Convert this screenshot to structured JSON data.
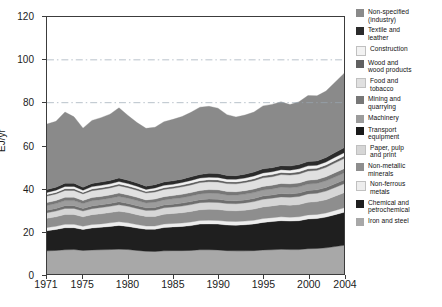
{
  "chart_data": {
    "type": "area",
    "title": "",
    "xlabel": "",
    "ylabel": "EJ/yr",
    "xlim": [
      1971,
      2004
    ],
    "ylim": [
      0,
      120
    ],
    "ytick_values": [
      0,
      20,
      40,
      60,
      80,
      100,
      120
    ],
    "xtick_values": [
      1971,
      1975,
      1980,
      1985,
      1990,
      1995,
      2000,
      2004
    ],
    "grid": "horizontal-dashed-at-80-and-100",
    "legend_position": "right",
    "stack_order_bottom_to_top": [
      "Iron and steel",
      "Chemical and petrochemical",
      "Non-ferrous metals",
      "Non-metallic minerals",
      "Paper, pulp and print",
      "Transport equipment",
      "Machinery",
      "Mining and quarrying",
      "Food and tobacco",
      "Wood and wood products",
      "Construction",
      "Textile and leather",
      "Non-specified (industry)"
    ],
    "x": [
      1971,
      1972,
      1973,
      1974,
      1975,
      1976,
      1977,
      1978,
      1979,
      1980,
      1981,
      1982,
      1983,
      1984,
      1985,
      1986,
      1987,
      1988,
      1989,
      1990,
      1991,
      1992,
      1993,
      1994,
      1995,
      1996,
      1997,
      1998,
      1999,
      2000,
      2001,
      2002,
      2003,
      2004
    ],
    "series": [
      {
        "name": "Iron and steel",
        "color": "#a8a8a8",
        "values": [
          10.8,
          11.0,
          11.3,
          11.4,
          11.0,
          11.2,
          11.3,
          11.4,
          11.6,
          11.4,
          11.0,
          10.6,
          10.5,
          10.8,
          10.9,
          10.9,
          11.0,
          11.3,
          11.3,
          11.2,
          10.9,
          10.8,
          10.8,
          10.9,
          11.2,
          11.3,
          11.5,
          11.4,
          11.4,
          11.8,
          11.9,
          12.2,
          12.8,
          13.4
        ]
      },
      {
        "name": "Chemical and petrochemical",
        "color": "#1f1f1f",
        "values": [
          9.4,
          9.8,
          10.3,
          10.2,
          9.8,
          10.3,
          10.5,
          10.8,
          11.1,
          10.8,
          10.5,
          10.3,
          10.4,
          10.9,
          11.1,
          11.3,
          11.6,
          12.0,
          12.1,
          12.1,
          12.0,
          12.0,
          12.2,
          12.5,
          12.9,
          13.2,
          13.4,
          13.3,
          13.5,
          13.9,
          14.0,
          14.4,
          14.9,
          15.4
        ]
      },
      {
        "name": "Non-ferrous metals",
        "color": "#ededed",
        "values": [
          1.5,
          1.5,
          1.6,
          1.6,
          1.5,
          1.6,
          1.6,
          1.7,
          1.7,
          1.7,
          1.6,
          1.5,
          1.5,
          1.6,
          1.6,
          1.6,
          1.7,
          1.7,
          1.7,
          1.7,
          1.7,
          1.7,
          1.7,
          1.7,
          1.8,
          1.8,
          1.8,
          1.8,
          1.8,
          1.9,
          1.9,
          1.9,
          2.0,
          2.1
        ]
      },
      {
        "name": "Non-metallic minerals",
        "color": "#8e8e8e",
        "values": [
          4.3,
          4.4,
          4.6,
          4.6,
          4.4,
          4.6,
          4.7,
          4.8,
          4.9,
          4.8,
          4.6,
          4.5,
          4.5,
          4.6,
          4.7,
          4.8,
          4.9,
          5.0,
          5.1,
          5.1,
          5.0,
          5.0,
          5.1,
          5.2,
          5.4,
          5.5,
          5.6,
          5.6,
          5.7,
          5.9,
          6.0,
          6.2,
          6.6,
          7.0
        ]
      },
      {
        "name": "Paper, pulp and print",
        "color": "#d6d6d6",
        "values": [
          2.6,
          2.7,
          2.8,
          2.8,
          2.7,
          2.8,
          2.9,
          2.9,
          3.0,
          2.9,
          2.9,
          2.8,
          2.9,
          3.0,
          3.0,
          3.1,
          3.2,
          3.3,
          3.3,
          3.3,
          3.3,
          3.3,
          3.4,
          3.5,
          3.6,
          3.6,
          3.7,
          3.7,
          3.8,
          3.9,
          3.9,
          4.0,
          4.1,
          4.2
        ]
      },
      {
        "name": "Transport equipment",
        "color": "#6e6e6e",
        "values": [
          1.2,
          1.2,
          1.3,
          1.3,
          1.2,
          1.3,
          1.3,
          1.3,
          1.4,
          1.3,
          1.3,
          1.2,
          1.3,
          1.3,
          1.3,
          1.4,
          1.4,
          1.4,
          1.5,
          1.5,
          1.4,
          1.4,
          1.4,
          1.5,
          1.5,
          1.5,
          1.6,
          1.6,
          1.6,
          1.6,
          1.6,
          1.7,
          1.7,
          1.8
        ]
      },
      {
        "name": "Machinery",
        "color": "#9c9c9c",
        "values": [
          2.2,
          2.3,
          2.4,
          2.4,
          2.3,
          2.4,
          2.4,
          2.5,
          2.5,
          2.5,
          2.4,
          2.3,
          2.4,
          2.4,
          2.5,
          2.5,
          2.6,
          2.7,
          2.7,
          2.7,
          2.6,
          2.6,
          2.7,
          2.7,
          2.8,
          2.8,
          2.9,
          2.9,
          2.9,
          3.0,
          3.0,
          3.1,
          3.2,
          3.3
        ]
      },
      {
        "name": "Mining and quarrying",
        "color": "#777777",
        "values": [
          1.4,
          1.4,
          1.5,
          1.5,
          1.4,
          1.5,
          1.5,
          1.5,
          1.6,
          1.5,
          1.5,
          1.4,
          1.5,
          1.5,
          1.5,
          1.6,
          1.6,
          1.6,
          1.7,
          1.7,
          1.6,
          1.6,
          1.6,
          1.7,
          1.7,
          1.7,
          1.8,
          1.8,
          1.8,
          1.8,
          1.8,
          1.9,
          2.0,
          2.0
        ]
      },
      {
        "name": "Food and tobacco",
        "color": "#e0e0e0",
        "values": [
          3.0,
          3.1,
          3.2,
          3.2,
          3.1,
          3.2,
          3.3,
          3.3,
          3.4,
          3.4,
          3.3,
          3.2,
          3.3,
          3.4,
          3.4,
          3.5,
          3.6,
          3.7,
          3.7,
          3.7,
          3.7,
          3.7,
          3.8,
          3.9,
          4.0,
          4.0,
          4.1,
          4.1,
          4.2,
          4.3,
          4.3,
          4.4,
          4.6,
          4.7
        ]
      },
      {
        "name": "Wood and wood products",
        "color": "#606060",
        "values": [
          0.7,
          0.7,
          0.8,
          0.8,
          0.7,
          0.8,
          0.8,
          0.8,
          0.8,
          0.8,
          0.8,
          0.7,
          0.8,
          0.8,
          0.8,
          0.8,
          0.9,
          0.9,
          0.9,
          0.9,
          0.9,
          0.9,
          0.9,
          0.9,
          1.0,
          1.0,
          1.0,
          1.0,
          1.0,
          1.0,
          1.0,
          1.1,
          1.1,
          1.2
        ]
      },
      {
        "name": "Construction",
        "color": "#f2f2f2",
        "values": [
          1.0,
          1.0,
          1.1,
          1.1,
          1.0,
          1.1,
          1.1,
          1.1,
          1.2,
          1.1,
          1.1,
          1.0,
          1.1,
          1.1,
          1.1,
          1.2,
          1.2,
          1.2,
          1.2,
          1.2,
          1.2,
          1.2,
          1.2,
          1.3,
          1.3,
          1.3,
          1.3,
          1.3,
          1.4,
          1.4,
          1.4,
          1.4,
          1.5,
          1.5
        ]
      },
      {
        "name": "Textile and leather",
        "color": "#2b2b2b",
        "values": [
          1.4,
          1.4,
          1.5,
          1.5,
          1.4,
          1.5,
          1.5,
          1.6,
          1.6,
          1.6,
          1.5,
          1.5,
          1.5,
          1.6,
          1.6,
          1.6,
          1.7,
          1.7,
          1.8,
          1.8,
          1.7,
          1.7,
          1.8,
          1.8,
          1.9,
          1.9,
          1.9,
          1.9,
          2.0,
          2.0,
          2.0,
          2.1,
          2.2,
          2.3
        ]
      },
      {
        "name": "Non-specified (industry)",
        "color": "#8a8a8a",
        "values": [
          30.5,
          30.8,
          33.2,
          31.0,
          27.6,
          29.4,
          30.1,
          30.9,
          32.8,
          30.2,
          28.2,
          27.0,
          26.8,
          28.1,
          28.7,
          29.2,
          30.1,
          31.4,
          31.3,
          30.5,
          28.4,
          27.4,
          27.6,
          28.0,
          29.4,
          29.6,
          29.8,
          28.7,
          29.3,
          30.8,
          30.4,
          31.0,
          32.8,
          34.7
        ]
      }
    ]
  },
  "axes": {
    "y_title": "EJ/yr",
    "y_ticks": [
      "0",
      "20",
      "40",
      "60",
      "80",
      "100",
      "120"
    ],
    "x_ticks": [
      "1971",
      "1975",
      "1980",
      "1985",
      "1990",
      "1995",
      "2000",
      "2004"
    ]
  },
  "legend": {
    "items": [
      {
        "label_line1": "Non-specified",
        "label_line2": "(industry)",
        "color": "#8a8a8a"
      },
      {
        "label_line1": "Textile and",
        "label_line2": "leather",
        "color": "#2b2b2b"
      },
      {
        "label_line1": "Construction",
        "label_line2": "",
        "color": "#f2f2f2"
      },
      {
        "label_line1": "Wood and",
        "label_line2": "wood products",
        "color": "#606060"
      },
      {
        "label_line1": "Food and",
        "label_line2": "tobacco",
        "color": "#e0e0e0"
      },
      {
        "label_line1": "Mining and",
        "label_line2": "quarrying",
        "color": "#777777"
      },
      {
        "label_line1": "Machinery",
        "label_line2": "",
        "color": "#9c9c9c"
      },
      {
        "label_line1": "Transport",
        "label_line2": "equipment",
        "color": "#1a1a1a"
      },
      {
        "label_line1": "Paper, pulp",
        "label_line2": "and print",
        "color": "#d6d6d6"
      },
      {
        "label_line1": "Non-metallic",
        "label_line2": "minerals",
        "color": "#8e8e8e"
      },
      {
        "label_line1": "Non-ferrous",
        "label_line2": "metals",
        "color": "#ededed"
      },
      {
        "label_line1": "Chemical and",
        "label_line2": "petrochemical",
        "color": "#1f1f1f"
      },
      {
        "label_line1": "Iron and steel",
        "label_line2": "",
        "color": "#a8a8a8"
      }
    ]
  }
}
